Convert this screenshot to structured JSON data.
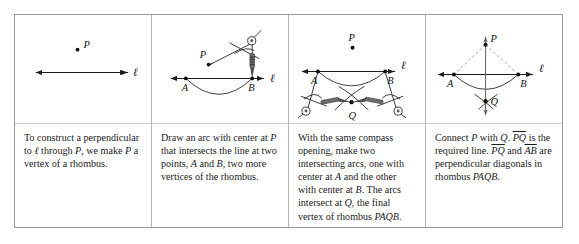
{
  "figure": {
    "title_visible": false,
    "panel_count": 4,
    "border_color": "#9a9a9a",
    "divider_color": "#b4b4b4",
    "ink_color": "#1a1a1a",
    "construction_color": "#9a9a9a"
  },
  "panels": [
    {
      "id": "step-1",
      "step_number": 1,
      "caption": "To construct a perpendicular to ℓ through P, we make P a vertex of a rhombus.",
      "caption_segments": [
        {
          "text": "To construct a perpendicular to ",
          "style": "roman"
        },
        {
          "text": "ℓ",
          "style": "italic"
        },
        {
          "text": " through ",
          "style": "roman"
        },
        {
          "text": "P",
          "style": "italic"
        },
        {
          "text": ", we make ",
          "style": "roman"
        },
        {
          "text": "P",
          "style": "italic"
        },
        {
          "text": " a vertex of a rhombus.",
          "style": "roman"
        }
      ],
      "diagram": {
        "kind": "point-and-line",
        "labels": [
          {
            "name": "P",
            "text": "P",
            "x": 72,
            "y": 33
          },
          {
            "name": "line-ell",
            "text": "ℓ",
            "x": 125,
            "y": 61
          }
        ],
        "points": [
          {
            "name": "P",
            "x": 63,
            "y": 35
          }
        ],
        "line": {
          "name": "line-ell",
          "x1": 15,
          "y1": 58,
          "x2": 117,
          "y2": 58,
          "double_arrow": true
        }
      }
    },
    {
      "id": "step-2",
      "step_number": 2,
      "caption": "Draw an arc with center at P that intersects the line at two points, A and B, two more vertices of the rhombus.",
      "caption_segments": [
        {
          "text": "Draw an arc with center at ",
          "style": "roman"
        },
        {
          "text": "P",
          "style": "italic"
        },
        {
          "text": " that intersects the line at two points, ",
          "style": "roman"
        },
        {
          "text": "A",
          "style": "italic"
        },
        {
          "text": " and ",
          "style": "roman"
        },
        {
          "text": "B",
          "style": "italic"
        },
        {
          "text": ", two more vertices of the rhombus.",
          "style": "roman"
        }
      ],
      "diagram": {
        "kind": "arc-with-compass",
        "labels": [
          {
            "name": "P",
            "text": "P",
            "x": 53,
            "y": 41
          },
          {
            "name": "A",
            "text": "A",
            "x": 31,
            "y": 78
          },
          {
            "name": "B",
            "text": "B",
            "x": 97,
            "y": 78
          },
          {
            "name": "line-ell",
            "text": "ℓ",
            "x": 128,
            "y": 66
          }
        ],
        "points": [
          {
            "name": "P",
            "x": 57,
            "y": 50
          },
          {
            "name": "A",
            "x": 34,
            "y": 64
          },
          {
            "name": "B",
            "x": 101,
            "y": 64
          }
        ],
        "line": {
          "name": "line-ell",
          "x1": 12,
          "y1": 64,
          "x2": 120,
          "y2": 64,
          "double_arrow": true
        },
        "compass": {
          "name": "compass-tool",
          "pivot_x": 57,
          "pivot_y": 50,
          "pen_x": 101,
          "pen_y": 64
        }
      }
    },
    {
      "id": "step-3",
      "step_number": 3,
      "caption": "With the same compass opening, make two intersecting arcs, one with center at A and the other with center at B. The arcs intersect at Q, the final vertex of rhombus PAQB.",
      "caption_segments": [
        {
          "text": "With the same compass opening, make two intersecting arcs, one with center at ",
          "style": "roman"
        },
        {
          "text": "A",
          "style": "italic"
        },
        {
          "text": " and the other with center at ",
          "style": "roman"
        },
        {
          "text": "B",
          "style": "italic"
        },
        {
          "text": ". The arcs intersect at ",
          "style": "roman"
        },
        {
          "text": "Q",
          "style": "italic"
        },
        {
          "text": ", the final vertex of rhombus ",
          "style": "roman"
        },
        {
          "text": "PAQB",
          "style": "italic"
        },
        {
          "text": ".",
          "style": "roman"
        }
      ],
      "diagram": {
        "kind": "two-arcs-two-compasses",
        "labels": [
          {
            "name": "P",
            "text": "P",
            "x": 62,
            "y": 25
          },
          {
            "name": "A",
            "text": "A",
            "x": 24,
            "y": 72
          },
          {
            "name": "B",
            "text": "B",
            "x": 101,
            "y": 72
          },
          {
            "name": "Q",
            "text": "Q",
            "x": 63,
            "y": 105
          },
          {
            "name": "line-ell",
            "text": "ℓ",
            "x": 118,
            "y": 58
          }
        ],
        "points": [
          {
            "name": "P",
            "x": 64,
            "y": 33
          },
          {
            "name": "A",
            "x": 29,
            "y": 57
          },
          {
            "name": "B",
            "x": 97,
            "y": 57
          },
          {
            "name": "Q",
            "x": 63,
            "y": 88
          }
        ],
        "line": {
          "name": "line-ell",
          "x1": 8,
          "y1": 57,
          "x2": 112,
          "y2": 57,
          "double_arrow": true
        }
      }
    },
    {
      "id": "step-4",
      "step_number": 4,
      "caption": "Connect P with Q. PQ is the required line. PQ and AB are perpendicular diagonals in rhombus PAQB.",
      "caption_segments": [
        {
          "text": "Connect ",
          "style": "roman"
        },
        {
          "text": "P",
          "style": "italic"
        },
        {
          "text": " with ",
          "style": "roman"
        },
        {
          "text": "Q",
          "style": "italic"
        },
        {
          "text": ". ",
          "style": "roman"
        },
        {
          "text": "PQ",
          "style": "overline-italic"
        },
        {
          "text": " is the required line. ",
          "style": "roman"
        },
        {
          "text": "PQ",
          "style": "overline-italic"
        },
        {
          "text": " and ",
          "style": "roman"
        },
        {
          "text": "AB",
          "style": "overline-italic"
        },
        {
          "text": " are perpendicular diagonals in rhombus ",
          "style": "roman"
        },
        {
          "text": "PAQB",
          "style": "italic"
        },
        {
          "text": ".",
          "style": "roman"
        }
      ],
      "diagram": {
        "kind": "completed-perpendicular",
        "labels": [
          {
            "name": "P",
            "text": "P",
            "x": 68,
            "y": 24
          },
          {
            "name": "A",
            "text": "A",
            "x": 24,
            "y": 74
          },
          {
            "name": "B",
            "text": "B",
            "x": 99,
            "y": 74
          },
          {
            "name": "Q",
            "text": "Q",
            "x": 69,
            "y": 92
          },
          {
            "name": "line-ell",
            "text": "ℓ",
            "x": 123,
            "y": 58
          }
        ],
        "points": [
          {
            "name": "P",
            "x": 60,
            "y": 30
          },
          {
            "name": "A",
            "x": 28,
            "y": 60
          },
          {
            "name": "B",
            "x": 93,
            "y": 60
          },
          {
            "name": "Q",
            "x": 60,
            "y": 87
          }
        ],
        "line": {
          "name": "line-ell",
          "x1": 8,
          "y1": 60,
          "x2": 115,
          "y2": 60,
          "double_arrow": true
        },
        "perpendicular": {
          "name": "line-PQ",
          "x1": 60,
          "y1": 17,
          "x2": 60,
          "y2": 104,
          "double_arrow": true
        }
      }
    }
  ]
}
